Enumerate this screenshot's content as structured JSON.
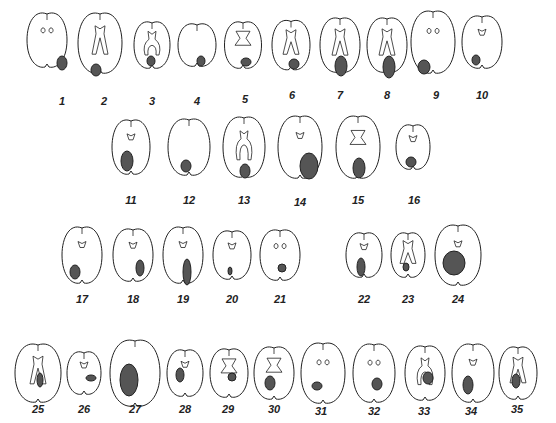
{
  "figure": {
    "colors": {
      "outline": "#222222",
      "lesion": "#555555",
      "background": "#ffffff"
    },
    "slices": [
      {
        "n": "1",
        "x": 47,
        "y": 35,
        "w": 40,
        "h": 58,
        "lx": 62,
        "ly": 95,
        "vent": "dots",
        "lesion": {
          "cx": 62,
          "cy": 63,
          "rx": 5,
          "ry": 7
        }
      },
      {
        "n": "2",
        "x": 100,
        "y": 38,
        "w": 44,
        "h": 64,
        "lx": 104,
        "ly": 95,
        "vent": "tall",
        "lesion": {
          "cx": 96,
          "cy": 70,
          "rx": 5,
          "ry": 6
        }
      },
      {
        "n": "3",
        "x": 152,
        "y": 40,
        "w": 36,
        "h": 50,
        "lx": 152,
        "ly": 95,
        "vent": "horseshoe",
        "lesion": {
          "cx": 151,
          "cy": 61,
          "rx": 4,
          "ry": 5
        }
      },
      {
        "n": "4",
        "x": 197,
        "y": 40,
        "w": 38,
        "h": 46,
        "lx": 197,
        "ly": 95,
        "vent": "none",
        "lesion": {
          "cx": 201,
          "cy": 61,
          "rx": 4,
          "ry": 5
        }
      },
      {
        "n": "5",
        "x": 243,
        "y": 40,
        "w": 37,
        "h": 50,
        "lx": 245,
        "ly": 93,
        "vent": "butterfly",
        "lesion": {
          "cx": 246,
          "cy": 62,
          "rx": 5,
          "ry": 4
        }
      },
      {
        "n": "6",
        "x": 291,
        "y": 40,
        "w": 38,
        "h": 53,
        "lx": 292,
        "ly": 89,
        "vent": "tall",
        "lesion": {
          "cx": 294,
          "cy": 64,
          "rx": 5,
          "ry": 5
        }
      },
      {
        "n": "7",
        "x": 340,
        "y": 40,
        "w": 40,
        "h": 58,
        "lx": 340,
        "ly": 89,
        "vent": "tall",
        "lesion": {
          "cx": 341,
          "cy": 66,
          "rx": 6,
          "ry": 10
        }
      },
      {
        "n": "8",
        "x": 387,
        "y": 40,
        "w": 40,
        "h": 58,
        "lx": 387,
        "ly": 89,
        "vent": "tall",
        "lesion": {
          "cx": 389,
          "cy": 67,
          "rx": 6,
          "ry": 11
        }
      },
      {
        "n": "9",
        "x": 433,
        "y": 37,
        "w": 44,
        "h": 66,
        "lx": 436,
        "ly": 89,
        "vent": "dots",
        "lesion": {
          "cx": 424,
          "cy": 67,
          "rx": 6,
          "ry": 7
        }
      },
      {
        "n": "10",
        "x": 482,
        "y": 37,
        "w": 40,
        "h": 56,
        "lx": 482,
        "ly": 89,
        "vent": "small",
        "lesion": {
          "cx": 476,
          "cy": 60,
          "rx": 4,
          "ry": 5
        }
      },
      {
        "n": "11",
        "x": 131,
        "y": 142,
        "w": 38,
        "h": 58,
        "lx": 131,
        "ly": 194,
        "vent": "small",
        "lesion": {
          "cx": 127,
          "cy": 161,
          "rx": 6,
          "ry": 10
        }
      },
      {
        "n": "12",
        "x": 189,
        "y": 142,
        "w": 42,
        "h": 60,
        "lx": 189,
        "ly": 194,
        "vent": "none",
        "lesion": {
          "cx": 186,
          "cy": 166,
          "rx": 5,
          "ry": 6
        }
      },
      {
        "n": "13",
        "x": 244,
        "y": 142,
        "w": 42,
        "h": 64,
        "lx": 244,
        "ly": 194,
        "vent": "horseshoe",
        "lesion": {
          "cx": 245,
          "cy": 171,
          "rx": 5,
          "ry": 7
        }
      },
      {
        "n": "14",
        "x": 300,
        "y": 142,
        "w": 44,
        "h": 66,
        "lx": 300,
        "ly": 196,
        "vent": "small",
        "lesion": {
          "cx": 309,
          "cy": 166,
          "rx": 9,
          "ry": 13
        }
      },
      {
        "n": "15",
        "x": 358,
        "y": 142,
        "w": 44,
        "h": 66,
        "lx": 358,
        "ly": 194,
        "vent": "butterfly",
        "lesion": {
          "cx": 359,
          "cy": 168,
          "rx": 6,
          "ry": 10
        }
      },
      {
        "n": "16",
        "x": 413,
        "y": 142,
        "w": 34,
        "h": 48,
        "lx": 414,
        "ly": 194,
        "vent": "small",
        "lesion": {
          "cx": 411,
          "cy": 162,
          "rx": 5,
          "ry": 5
        }
      },
      {
        "n": "17",
        "x": 82,
        "y": 250,
        "w": 40,
        "h": 60,
        "lx": 82,
        "ly": 293,
        "vent": "small",
        "lesion": {
          "cx": 75,
          "cy": 272,
          "rx": 5,
          "ry": 7
        }
      },
      {
        "n": "18",
        "x": 133,
        "y": 250,
        "w": 40,
        "h": 56,
        "lx": 133,
        "ly": 293,
        "vent": "small",
        "lesion": {
          "cx": 140,
          "cy": 268,
          "rx": 4,
          "ry": 8
        }
      },
      {
        "n": "19",
        "x": 183,
        "y": 250,
        "w": 40,
        "h": 60,
        "lx": 183,
        "ly": 293,
        "vent": "small",
        "lesion": {
          "cx": 187,
          "cy": 272,
          "rx": 4,
          "ry": 13
        }
      },
      {
        "n": "20",
        "x": 232,
        "y": 250,
        "w": 38,
        "h": 52,
        "lx": 232,
        "ly": 293,
        "vent": "small",
        "lesion": {
          "cx": 230,
          "cy": 271,
          "rx": 2,
          "ry": 4
        }
      },
      {
        "n": "21",
        "x": 280,
        "y": 250,
        "w": 40,
        "h": 54,
        "lx": 280,
        "ly": 293,
        "vent": "dots",
        "lesion": {
          "cx": 282,
          "cy": 268,
          "rx": 4,
          "ry": 4
        }
      },
      {
        "n": "22",
        "x": 364,
        "y": 250,
        "w": 36,
        "h": 48,
        "lx": 364,
        "ly": 293,
        "vent": "small",
        "lesion": {
          "cx": 361,
          "cy": 267,
          "rx": 4,
          "ry": 9
        }
      },
      {
        "n": "23",
        "x": 408,
        "y": 250,
        "w": 34,
        "h": 48,
        "lx": 408,
        "ly": 293,
        "vent": "tall",
        "lesion": {
          "cx": 406,
          "cy": 267,
          "rx": 3,
          "ry": 4
        }
      },
      {
        "n": "24",
        "x": 458,
        "y": 250,
        "w": 46,
        "h": 64,
        "lx": 458,
        "ly": 293,
        "vent": "small",
        "lesion": {
          "cx": 454,
          "cy": 263,
          "rx": 11,
          "ry": 12
        }
      },
      {
        "n": "25",
        "x": 38,
        "y": 368,
        "w": 46,
        "h": 62,
        "lx": 38,
        "ly": 403,
        "vent": "tall",
        "lesion": {
          "cx": 40,
          "cy": 380,
          "rx": 3,
          "ry": 7
        }
      },
      {
        "n": "26",
        "x": 84,
        "y": 368,
        "w": 34,
        "h": 46,
        "lx": 84,
        "ly": 403,
        "vent": "small",
        "lesion": {
          "cx": 91,
          "cy": 378,
          "rx": 5,
          "ry": 3
        }
      },
      {
        "n": "27",
        "x": 135,
        "y": 368,
        "w": 50,
        "h": 70,
        "lx": 135,
        "ly": 403,
        "vent": "none",
        "lesion": {
          "cx": 129,
          "cy": 380,
          "rx": 9,
          "ry": 16
        }
      },
      {
        "n": "28",
        "x": 185,
        "y": 368,
        "w": 36,
        "h": 50,
        "lx": 185,
        "ly": 403,
        "vent": "small",
        "lesion": {
          "cx": 180,
          "cy": 375,
          "rx": 4,
          "ry": 7
        }
      },
      {
        "n": "29",
        "x": 229,
        "y": 368,
        "w": 38,
        "h": 52,
        "lx": 228,
        "ly": 403,
        "vent": "butterfly",
        "lesion": {
          "cx": 232,
          "cy": 377,
          "rx": 4,
          "ry": 4
        }
      },
      {
        "n": "30",
        "x": 274,
        "y": 368,
        "w": 40,
        "h": 56,
        "lx": 274,
        "ly": 403,
        "vent": "butterfly",
        "lesion": {
          "cx": 270,
          "cy": 383,
          "rx": 5,
          "ry": 7
        }
      },
      {
        "n": "31",
        "x": 323,
        "y": 368,
        "w": 44,
        "h": 64,
        "lx": 321,
        "ly": 405,
        "vent": "dots",
        "lesion": {
          "cx": 317,
          "cy": 386,
          "rx": 5,
          "ry": 4
        }
      },
      {
        "n": "32",
        "x": 374,
        "y": 368,
        "w": 42,
        "h": 62,
        "lx": 374,
        "ly": 405,
        "vent": "dots",
        "lesion": {
          "cx": 377,
          "cy": 384,
          "rx": 5,
          "ry": 6
        }
      },
      {
        "n": "33",
        "x": 425,
        "y": 368,
        "w": 40,
        "h": 58,
        "lx": 424,
        "ly": 405,
        "vent": "horseshoe",
        "lesion": {
          "cx": 428,
          "cy": 378,
          "rx": 5,
          "ry": 6
        }
      },
      {
        "n": "34",
        "x": 473,
        "y": 368,
        "w": 42,
        "h": 62,
        "lx": 471,
        "ly": 405,
        "vent": "small",
        "lesion": {
          "cx": 468,
          "cy": 385,
          "rx": 5,
          "ry": 9
        }
      },
      {
        "n": "35",
        "x": 518,
        "y": 368,
        "w": 38,
        "h": 56,
        "lx": 517,
        "ly": 403,
        "vent": "tall",
        "lesion": {
          "cx": 516,
          "cy": 381,
          "rx": 4,
          "ry": 7
        }
      }
    ]
  }
}
